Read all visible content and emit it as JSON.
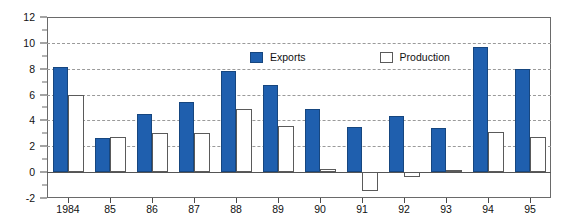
{
  "chart_data": {
    "type": "bar",
    "title": "",
    "subtitle": "",
    "xlabel": "",
    "ylabel": "",
    "categories": [
      "1984",
      "85",
      "86",
      "87",
      "88",
      "89",
      "90",
      "91",
      "92",
      "93",
      "94",
      "95"
    ],
    "series": [
      {
        "name": "Exports",
        "color": "#1f5fae",
        "values": [
          8.1,
          2.6,
          4.5,
          5.4,
          7.8,
          6.7,
          4.9,
          3.5,
          4.3,
          3.4,
          9.7,
          8.0
        ]
      },
      {
        "name": "Production",
        "color": "#ffffff",
        "values": [
          6.0,
          2.7,
          3.0,
          3.0,
          4.9,
          3.6,
          0.2,
          -1.5,
          -0.4,
          0.15,
          3.1,
          2.7
        ]
      }
    ],
    "ylim": [
      -2,
      12
    ],
    "yticks": [
      -2,
      0,
      2,
      4,
      6,
      8,
      10,
      12
    ],
    "yticklabels": [
      "-2",
      "0",
      "2",
      "4",
      "6",
      "8",
      "10",
      "12"
    ],
    "yminorticks": [
      -1,
      1,
      3,
      5,
      7,
      9,
      11
    ],
    "grid": true,
    "gridstyle": "dashed-horizontal",
    "legend_position": "upper-center",
    "legend": [
      {
        "label": "Exports",
        "swatch": "filled-blue-square"
      },
      {
        "label": "Production",
        "swatch": "open-white-square"
      }
    ]
  },
  "axes": {
    "y_label_0": "12",
    "y_label_1": "10",
    "y_label_2": "8",
    "y_label_3": "6",
    "y_label_4": "4",
    "y_label_5": "2",
    "y_label_6": "0",
    "y_label_7": "-2"
  }
}
